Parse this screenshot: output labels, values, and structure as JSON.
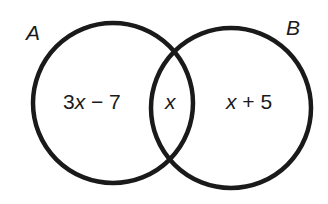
{
  "diagram": {
    "type": "venn",
    "sets": [
      {
        "label": "A",
        "color": "#1a1a1a"
      },
      {
        "label": "B",
        "color": "#1a1a1a"
      }
    ],
    "regions": {
      "a_only": {
        "prefix": "3",
        "var": "x",
        "suffix": " − 7"
      },
      "intersection": {
        "var": "x"
      },
      "b_only": {
        "var": "x",
        "suffix": " + 5"
      }
    },
    "region_text": {
      "a_only": "3x − 7",
      "intersection": "x",
      "b_only": "x + 5"
    }
  }
}
